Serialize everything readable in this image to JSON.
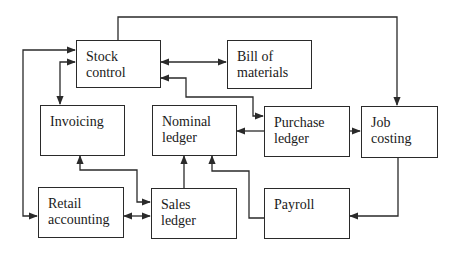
{
  "diagram": {
    "type": "flowchart",
    "nodes": [
      {
        "id": "stock_control",
        "label_lines": [
          "Stock",
          "control"
        ]
      },
      {
        "id": "bill_of_materials",
        "label_lines": [
          "Bill of",
          "materials"
        ]
      },
      {
        "id": "invoicing",
        "label_lines": [
          "Invoicing"
        ]
      },
      {
        "id": "nominal_ledger",
        "label_lines": [
          "Nominal",
          "ledger"
        ]
      },
      {
        "id": "purchase_ledger",
        "label_lines": [
          "Purchase",
          "ledger"
        ]
      },
      {
        "id": "job_costing",
        "label_lines": [
          "Job",
          "costing"
        ]
      },
      {
        "id": "retail_accounting",
        "label_lines": [
          "Retail",
          "accounting"
        ]
      },
      {
        "id": "sales_ledger",
        "label_lines": [
          "Sales",
          "ledger"
        ]
      },
      {
        "id": "payroll",
        "label_lines": [
          "Payroll"
        ]
      }
    ],
    "edges": [
      {
        "from": "stock_control",
        "to": "job_costing",
        "direction": "forward"
      },
      {
        "from": "retail_accounting",
        "to": "stock_control",
        "direction": "both"
      },
      {
        "from": "stock_control",
        "to": "invoicing",
        "direction": "both"
      },
      {
        "from": "stock_control",
        "to": "bill_of_materials",
        "direction": "both"
      },
      {
        "from": "stock_control",
        "to": "purchase_ledger",
        "direction": "both"
      },
      {
        "from": "purchase_ledger",
        "to": "nominal_ledger",
        "direction": "forward"
      },
      {
        "from": "purchase_ledger",
        "to": "job_costing",
        "direction": "forward"
      },
      {
        "from": "job_costing",
        "to": "payroll",
        "direction": "forward"
      },
      {
        "from": "sales_ledger",
        "to": "invoicing",
        "direction": "both"
      },
      {
        "from": "retail_accounting",
        "to": "sales_ledger",
        "direction": "both"
      },
      {
        "from": "sales_ledger",
        "to": "nominal_ledger",
        "direction": "forward"
      },
      {
        "from": "payroll",
        "to": "nominal_ledger",
        "direction": "forward"
      }
    ]
  },
  "labels": {
    "stock_control": {
      "l1": "Stock",
      "l2": "control"
    },
    "bill_of_materials": {
      "l1": "Bill of",
      "l2": "materials"
    },
    "invoicing": {
      "l1": "Invoicing"
    },
    "nominal_ledger": {
      "l1": "Nominal",
      "l2": "ledger"
    },
    "purchase_ledger": {
      "l1": "Purchase",
      "l2": "ledger"
    },
    "job_costing": {
      "l1": "Job",
      "l2": "costing"
    },
    "retail_accounting": {
      "l1": "Retail",
      "l2": "accounting"
    },
    "sales_ledger": {
      "l1": "Sales",
      "l2": "ledger"
    },
    "payroll": {
      "l1": "Payroll"
    }
  },
  "colors": {
    "line": "#2a2a2a",
    "box_border": "#2a2a2a",
    "background": "#ffffff",
    "text": "#1a1a1a"
  }
}
